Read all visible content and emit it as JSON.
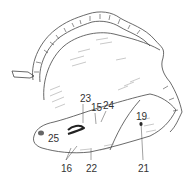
{
  "figure": {
    "labels": [
      {
        "id": "23",
        "text": "23",
        "x": 80,
        "y": 94
      },
      {
        "id": "15",
        "text": "15",
        "x": 91,
        "y": 103
      },
      {
        "id": "24",
        "text": "24",
        "x": 103,
        "y": 101
      },
      {
        "id": "19",
        "text": "19",
        "x": 136,
        "y": 112
      },
      {
        "id": "25",
        "text": "25",
        "x": 48,
        "y": 134
      },
      {
        "id": "16",
        "text": "16",
        "x": 61,
        "y": 164
      },
      {
        "id": "22",
        "text": "22",
        "x": 86,
        "y": 164
      },
      {
        "id": "21",
        "text": "21",
        "x": 138,
        "y": 164
      }
    ]
  }
}
